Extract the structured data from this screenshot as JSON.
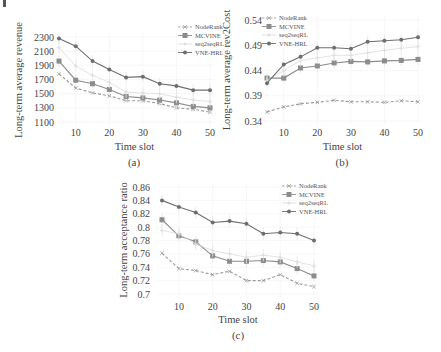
{
  "figure": {
    "captions": [
      "(a)",
      "(b)",
      "(c)"
    ]
  },
  "legend": [
    {
      "name": "NodeRank",
      "style": "dashed",
      "marker": "x",
      "color": "#9a9a9a"
    },
    {
      "name": "MCVINE",
      "style": "solid",
      "marker": "square",
      "color": "#8c8c8c"
    },
    {
      "name": "seq2seqRL",
      "style": "solid",
      "marker": "plus",
      "color": "#dcdcdc"
    },
    {
      "name": "VNE-HRL",
      "style": "solid",
      "marker": "circle",
      "color": "#6e6e6e"
    }
  ],
  "chart_data": [
    {
      "type": "line",
      "caption": "(a)",
      "title": "",
      "xlabel": "Time slot",
      "ylabel": "Long-term average revenue",
      "x": [
        5,
        10,
        15,
        20,
        25,
        30,
        35,
        40,
        45,
        50
      ],
      "xticks": [
        10,
        20,
        30,
        40,
        50
      ],
      "yticks": [
        1100,
        1300,
        1500,
        1700,
        1900,
        2100,
        2300
      ],
      "ylim": [
        1100,
        2300
      ],
      "grid": true,
      "legend_position": "upper right",
      "series": [
        {
          "name": "NodeRank",
          "values": [
            1780,
            1580,
            1510,
            1470,
            1400,
            1400,
            1360,
            1300,
            1280,
            1240
          ]
        },
        {
          "name": "MCVINE",
          "values": [
            1960,
            1690,
            1640,
            1560,
            1460,
            1440,
            1410,
            1370,
            1320,
            1300
          ]
        },
        {
          "name": "seq2seqRL",
          "values": [
            2150,
            1890,
            1760,
            1660,
            1520,
            1510,
            1500,
            1450,
            1410,
            1390
          ]
        },
        {
          "name": "VNE-HRL",
          "values": [
            2280,
            2170,
            1960,
            1840,
            1730,
            1740,
            1640,
            1610,
            1550,
            1550
          ]
        }
      ]
    },
    {
      "type": "line",
      "caption": "(b)",
      "title": "",
      "xlabel": "Time slot",
      "ylabel": "Long-term average rev2Cost",
      "x": [
        5,
        10,
        15,
        20,
        25,
        30,
        35,
        40,
        45,
        50
      ],
      "xticks": [
        10,
        20,
        30,
        40,
        50
      ],
      "yticks": [
        0.34,
        0.39,
        0.44,
        0.49,
        0.54
      ],
      "ylim": [
        0.34,
        0.54
      ],
      "grid": true,
      "legend_position": "upper left",
      "series": [
        {
          "name": "NodeRank",
          "values": [
            0.358,
            0.368,
            0.374,
            0.377,
            0.381,
            0.378,
            0.378,
            0.377,
            0.38,
            0.378
          ]
        },
        {
          "name": "MCVINE",
          "values": [
            0.425,
            0.425,
            0.445,
            0.449,
            0.455,
            0.458,
            0.457,
            0.459,
            0.46,
            0.462
          ]
        },
        {
          "name": "seq2seqRL",
          "values": [
            0.42,
            0.44,
            0.46,
            0.465,
            0.47,
            0.47,
            0.475,
            0.48,
            0.484,
            0.487
          ]
        },
        {
          "name": "VNE-HRL",
          "values": [
            0.415,
            0.452,
            0.467,
            0.485,
            0.485,
            0.483,
            0.497,
            0.499,
            0.501,
            0.506
          ]
        }
      ]
    },
    {
      "type": "line",
      "caption": "(c)",
      "title": "",
      "xlabel": "Time slot",
      "ylabel": "Long-term acceptance ratio",
      "x": [
        5,
        10,
        15,
        20,
        25,
        30,
        35,
        40,
        45,
        50
      ],
      "xticks": [
        10,
        20,
        30,
        40,
        50
      ],
      "yticks": [
        0.7,
        0.72,
        0.74,
        0.76,
        0.78,
        0.8,
        0.82,
        0.84,
        0.86
      ],
      "ylim": [
        0.7,
        0.86
      ],
      "grid": true,
      "legend_position": "upper right",
      "series": [
        {
          "name": "NodeRank",
          "values": [
            0.761,
            0.738,
            0.735,
            0.729,
            0.734,
            0.72,
            0.72,
            0.729,
            0.716,
            0.711
          ]
        },
        {
          "name": "MCVINE",
          "values": [
            0.811,
            0.787,
            0.778,
            0.757,
            0.749,
            0.749,
            0.75,
            0.748,
            0.738,
            0.727
          ]
        },
        {
          "name": "seq2seqRL",
          "values": [
            0.795,
            0.79,
            0.775,
            0.765,
            0.76,
            0.755,
            0.758,
            0.755,
            0.748,
            0.742
          ]
        },
        {
          "name": "VNE-HRL",
          "values": [
            0.84,
            0.83,
            0.822,
            0.807,
            0.809,
            0.805,
            0.79,
            0.792,
            0.79,
            0.78
          ]
        }
      ]
    }
  ],
  "layout": [
    {
      "left": 59,
      "right": 210,
      "top": 37,
      "bottom": 122,
      "legendX": 178,
      "legendY": 27,
      "ylabelX": 22,
      "ylabelY": 80,
      "tickLabelX": 54,
      "xTickY": 136,
      "xlabelY": 150,
      "captionY": 166,
      "captionX": 134,
      "decimals": 0
    },
    {
      "left": 267,
      "right": 418,
      "top": 20,
      "bottom": 121,
      "legendX": 262,
      "legendY": 18,
      "ylabelX": 230,
      "ylabelY": 70,
      "tickLabelX": 262,
      "xTickY": 136,
      "xlabelY": 150,
      "captionX": 342,
      "captionY": 166,
      "decimals": 2
    },
    {
      "left": 162,
      "right": 314,
      "top": 187,
      "bottom": 294,
      "legendX": 282,
      "legendY": 186,
      "ylabelX": 127,
      "ylabelY": 240,
      "tickLabelX": 150,
      "xTickY": 310,
      "xlabelY": 323,
      "captionX": 238,
      "captionY": 339,
      "decimals": 2
    }
  ]
}
